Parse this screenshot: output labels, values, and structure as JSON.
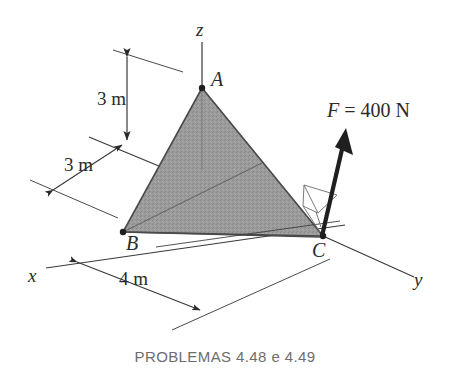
{
  "figure": {
    "caption": "PROBLEMAS 4.48 e 4.49",
    "points": {
      "A": "A",
      "B": "B",
      "C": "C"
    },
    "axes": {
      "x": "x",
      "y": "y",
      "z": "z"
    },
    "dimensions": {
      "height_z": "3 m",
      "depth_x": "3 m",
      "span_y": "4 m"
    },
    "force": {
      "label": "F = 400 N",
      "symbol": "F",
      "equals": " = ",
      "magnitude": "400 N"
    },
    "colors": {
      "plate_fill": "#9b9b9b",
      "stroke": "#2b2b2b",
      "thin_stroke": "#555555",
      "caption_color": "#6e6e6e",
      "background": "#ffffff"
    }
  }
}
